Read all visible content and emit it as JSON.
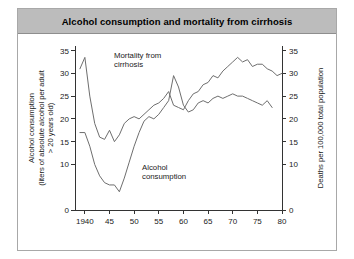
{
  "figure": {
    "title": "Alcohol consumption and mortality from cirrhosis",
    "title_bar_color": "#bcbcbc",
    "background_color": "#ffffff",
    "border_color": "#a8a8a8",
    "line_color": "#6e6e6e"
  },
  "chart_data": {
    "type": "line",
    "title": "Alcohol consumption and mortality from cirrhosis",
    "xlabel": "",
    "ylabel": "Alcohol consumption (liters of absolute alcohol per adult > 20 years old)",
    "y2label": "Deaths per 100,000 total population",
    "xlim": [
      1938,
      1980
    ],
    "ylim": [
      0,
      36
    ],
    "y2lim": [
      0,
      36
    ],
    "grid": false,
    "legend_position": "inline-annotations",
    "x_tick_labels": [
      "1940",
      "45",
      "50",
      "55",
      "60",
      "65",
      "70",
      "75",
      "80"
    ],
    "x_tick_values": [
      1940,
      1945,
      1950,
      1955,
      1960,
      1965,
      1970,
      1975,
      1980
    ],
    "y_tick_labels": [
      "0",
      "10",
      "15",
      "20",
      "25",
      "30",
      "35"
    ],
    "y_tick_values": [
      0,
      10,
      15,
      20,
      25,
      30,
      35
    ],
    "y2_tick_labels": [
      "0",
      "10",
      "15",
      "20",
      "25",
      "30",
      "35"
    ],
    "y2_tick_values": [
      0,
      10,
      15,
      20,
      25,
      30,
      35
    ],
    "series": [
      {
        "name": "Mortality from cirrhosis",
        "axis": "right",
        "annotation": "Mortality from cirrhosis",
        "x": [
          1939,
          1940,
          1941,
          1942,
          1943,
          1944,
          1945,
          1946,
          1947,
          1948,
          1949,
          1950,
          1951,
          1952,
          1953,
          1954,
          1955,
          1956,
          1957,
          1958,
          1959,
          1960,
          1961,
          1962,
          1963,
          1964,
          1965,
          1966,
          1967,
          1968,
          1969,
          1970,
          1971,
          1972,
          1973,
          1974,
          1975,
          1976,
          1977,
          1978,
          1979,
          1980
        ],
        "values": [
          31.0,
          33.5,
          25.0,
          19.0,
          16.0,
          15.5,
          17.5,
          15.0,
          16.5,
          19.0,
          20.0,
          20.5,
          20.0,
          21.0,
          22.0,
          23.0,
          23.5,
          24.5,
          26.0,
          23.0,
          22.5,
          22.0,
          24.0,
          25.5,
          26.0,
          27.5,
          28.0,
          29.5,
          29.0,
          30.5,
          31.5,
          32.5,
          33.5,
          32.5,
          33.0,
          31.5,
          32.0,
          32.0,
          31.0,
          30.5,
          29.5,
          30.0
        ]
      },
      {
        "name": "Alcohol consumption",
        "axis": "left",
        "annotation": "Alcohol consumption",
        "x": [
          1939,
          1940,
          1941,
          1942,
          1943,
          1944,
          1945,
          1946,
          1947,
          1948,
          1949,
          1950,
          1951,
          1952,
          1953,
          1954,
          1955,
          1956,
          1957,
          1958,
          1959,
          1960,
          1961,
          1962,
          1963,
          1964,
          1965,
          1966,
          1967,
          1968,
          1969,
          1970,
          1971,
          1972,
          1973,
          1974,
          1975,
          1976,
          1977,
          1978
        ],
        "values": [
          17.0,
          17.0,
          14.0,
          10.0,
          7.5,
          6.0,
          5.5,
          5.5,
          4.0,
          7.0,
          10.5,
          14.0,
          17.0,
          19.5,
          20.5,
          20.0,
          21.0,
          22.5,
          24.0,
          29.5,
          27.0,
          23.0,
          21.5,
          22.0,
          23.5,
          24.0,
          23.5,
          24.5,
          25.0,
          24.5,
          25.0,
          25.5,
          25.0,
          25.0,
          24.5,
          24.0,
          23.5,
          23.0,
          24.0,
          22.5
        ]
      }
    ]
  }
}
